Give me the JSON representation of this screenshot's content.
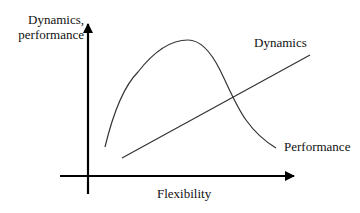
{
  "diagram": {
    "y_axis_label_line1": "Dynamics,",
    "y_axis_label_line2": "performance",
    "x_axis_label": "Flexibility",
    "curves": [
      {
        "name": "Dynamics",
        "shape": "straight rising line",
        "label": "Dynamics"
      },
      {
        "name": "Performance",
        "shape": "rising then peaking then falling curve",
        "label": "Performance"
      }
    ],
    "colors": {
      "line": "#333333",
      "axis": "#000000",
      "background": "#ffffff"
    }
  }
}
